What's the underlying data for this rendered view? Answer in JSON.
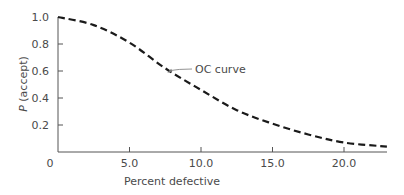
{
  "chart_data": {
    "type": "line",
    "title": "",
    "xlabel": "Percent defective",
    "ylabel_italic": "P",
    "ylabel_rest": " (accept)",
    "ylabel": "P (accept)",
    "xlim": [
      0,
      23
    ],
    "ylim": [
      0,
      1.0
    ],
    "grid": false,
    "legend": "none",
    "x_ticks": [
      {
        "value": 0,
        "label": "0"
      },
      {
        "value": 5,
        "label": "5.0"
      },
      {
        "value": 10,
        "label": "10.0"
      },
      {
        "value": 15,
        "label": "15.0"
      },
      {
        "value": 20,
        "label": "20.0"
      }
    ],
    "y_ticks": [
      {
        "value": 0.2,
        "label": "0.2"
      },
      {
        "value": 0.4,
        "label": "0.4"
      },
      {
        "value": 0.6,
        "label": "0.6"
      },
      {
        "value": 0.8,
        "label": "0.8"
      },
      {
        "value": 1.0,
        "label": "1.0"
      }
    ],
    "series": [
      {
        "name": "OC curve",
        "style": "dashed",
        "color": "#1a1a1a",
        "x": [
          0,
          2.5,
          5,
          7.5,
          10,
          12.5,
          15,
          17.5,
          20,
          23
        ],
        "y": [
          1.0,
          0.94,
          0.81,
          0.62,
          0.46,
          0.31,
          0.21,
          0.13,
          0.07,
          0.04
        ]
      }
    ],
    "annotations": [
      {
        "text": "OC curve",
        "points_to": {
          "x": 7.5,
          "y": 0.58
        }
      }
    ]
  },
  "colors": {
    "axis": "#555555",
    "curve": "#1a1a1a",
    "text": "#4a4a4a"
  }
}
